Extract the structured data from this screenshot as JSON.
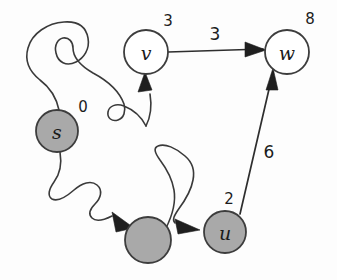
{
  "diagram": {
    "background_color": "#fdfdfd",
    "node_fill_visited": "#a9a9a9",
    "node_fill_unvisited": "#ffffff",
    "stroke_color": "#3d3d3d"
  },
  "nodes": [
    {
      "id": "s",
      "letter": "s",
      "distance": "0",
      "state": "filled",
      "cx": 57,
      "cy": 131,
      "r": 21,
      "label_x": 83,
      "label_y": 107
    },
    {
      "id": "v",
      "letter": "v",
      "distance": "3",
      "state": "open",
      "cx": 146,
      "cy": 52,
      "r": 22,
      "label_x": 168,
      "label_y": 21
    },
    {
      "id": "w",
      "letter": "w",
      "distance": "8",
      "state": "open",
      "cx": 287,
      "cy": 52,
      "r": 22,
      "label_x": 310,
      "label_y": 19
    },
    {
      "id": "x",
      "letter": "",
      "distance": "",
      "state": "filled",
      "cx": 148,
      "cy": 240,
      "r": 23,
      "label_x": 148,
      "label_y": 208
    },
    {
      "id": "u",
      "letter": "u",
      "distance": "2",
      "state": "filled",
      "cx": 225,
      "cy": 232,
      "r": 21,
      "label_x": 229,
      "label_y": 199
    }
  ],
  "edges": [
    {
      "id": "s-v",
      "from": "s",
      "to": "v",
      "weight": "",
      "style": "squiggle",
      "weight_x": 0,
      "weight_y": 0
    },
    {
      "id": "v-w",
      "from": "v",
      "to": "w",
      "weight": "3",
      "style": "straight",
      "weight_x": 215,
      "weight_y": 34
    },
    {
      "id": "s-x",
      "from": "s",
      "to": "x",
      "weight": "",
      "style": "squiggle",
      "weight_x": 0,
      "weight_y": 0
    },
    {
      "id": "x-u",
      "from": "x",
      "to": "u",
      "weight": "",
      "style": "squiggle",
      "weight_x": 0,
      "weight_y": 0
    },
    {
      "id": "u-w",
      "from": "u",
      "to": "w",
      "weight": "6",
      "style": "straight",
      "weight_x": 269,
      "weight_y": 152
    }
  ]
}
